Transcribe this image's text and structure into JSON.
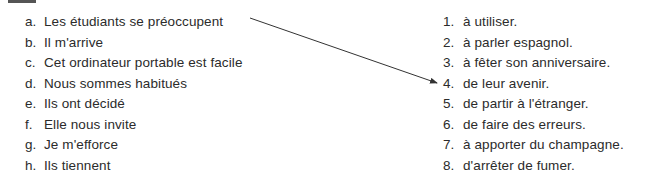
{
  "exercise": {
    "left_column": [
      {
        "label": "a.",
        "text": "Les étudiants se préoccupent"
      },
      {
        "label": "b.",
        "text": "Il m'arrive"
      },
      {
        "label": "c.",
        "text": "Cet ordinateur portable est facile"
      },
      {
        "label": "d.",
        "text": "Nous sommes habitués"
      },
      {
        "label": "e.",
        "text": "Ils ont décidé"
      },
      {
        "label": "f.",
        "text": "Elle nous invite"
      },
      {
        "label": "g.",
        "text": "Je m'efforce"
      },
      {
        "label": "h.",
        "text": "Ils tiennent"
      }
    ],
    "right_column": [
      {
        "label": "1.",
        "text": "à utiliser."
      },
      {
        "label": "2.",
        "text": "à parler espagnol."
      },
      {
        "label": "3.",
        "text": "à fêter son anniversaire."
      },
      {
        "label": "4.",
        "text": "de leur avenir."
      },
      {
        "label": "5.",
        "text": "de partir à l'étranger."
      },
      {
        "label": "6.",
        "text": "de faire des erreurs."
      },
      {
        "label": "7.",
        "text": "à apporter du champagne."
      },
      {
        "label": "8.",
        "text": "d'arrêter de fumer."
      }
    ],
    "example_match": {
      "from": "a",
      "to": "4"
    },
    "colors": {
      "text": "#2b2b2b",
      "arrow": "#333333"
    }
  }
}
